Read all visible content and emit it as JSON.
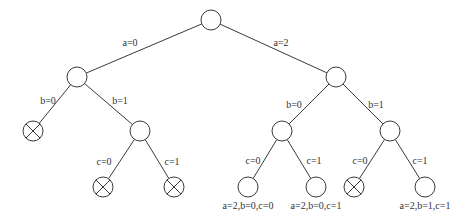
{
  "diagram": {
    "type": "decision-tree",
    "stroke_color": "#3a3a3a",
    "node_fill": "#ffffff",
    "node_radius": 10,
    "nodes": [
      {
        "id": "root",
        "x": 211,
        "y": 20,
        "pruned": false,
        "label": ""
      },
      {
        "id": "a0",
        "x": 77,
        "y": 77,
        "pruned": false,
        "label": ""
      },
      {
        "id": "a2",
        "x": 336,
        "y": 77,
        "pruned": false,
        "label": ""
      },
      {
        "id": "a0b0",
        "x": 33,
        "y": 131,
        "pruned": true,
        "label": ""
      },
      {
        "id": "a0b1",
        "x": 140,
        "y": 131,
        "pruned": false,
        "label": ""
      },
      {
        "id": "a2b0",
        "x": 282,
        "y": 131,
        "pruned": false,
        "label": ""
      },
      {
        "id": "a2b1",
        "x": 390,
        "y": 131,
        "pruned": false,
        "label": ""
      },
      {
        "id": "a0b1c0",
        "x": 103,
        "y": 187,
        "pruned": true,
        "label": ""
      },
      {
        "id": "a0b1c1",
        "x": 174,
        "y": 187,
        "pruned": true,
        "label": ""
      },
      {
        "id": "a2b0c0",
        "x": 248,
        "y": 187,
        "pruned": false,
        "label": "a=2,b=0,c=0"
      },
      {
        "id": "a2b0c1",
        "x": 316,
        "y": 187,
        "pruned": false,
        "label": "a=2,b=0,c=1"
      },
      {
        "id": "a2b1c0",
        "x": 354,
        "y": 187,
        "pruned": true,
        "label": ""
      },
      {
        "id": "a2b1c1",
        "x": 425,
        "y": 187,
        "pruned": false,
        "label": "a=2,b=1,c=1"
      }
    ],
    "edges": [
      {
        "from": "root",
        "to": "a0",
        "label": "a=0",
        "lx": 130,
        "ly": 46
      },
      {
        "from": "root",
        "to": "a2",
        "label": "a=2",
        "lx": 281,
        "ly": 46
      },
      {
        "from": "a0",
        "to": "a0b0",
        "label": "b=0",
        "lx": 48,
        "ly": 104
      },
      {
        "from": "a0",
        "to": "a0b1",
        "label": "b=1",
        "lx": 120,
        "ly": 104
      },
      {
        "from": "a2",
        "to": "a2b0",
        "label": "b=0",
        "lx": 294,
        "ly": 108
      },
      {
        "from": "a2",
        "to": "a2b1",
        "label": "b=1",
        "lx": 376,
        "ly": 108
      },
      {
        "from": "a0b1",
        "to": "a0b1c0",
        "label": "c=0",
        "lx": 104,
        "ly": 165
      },
      {
        "from": "a0b1",
        "to": "a0b1c1",
        "label": "c=1",
        "lx": 172,
        "ly": 165
      },
      {
        "from": "a2b0",
        "to": "a2b0c0",
        "label": "c=0",
        "lx": 253,
        "ly": 164
      },
      {
        "from": "a2b0",
        "to": "a2b0c1",
        "label": "c=1",
        "lx": 314,
        "ly": 164
      },
      {
        "from": "a2b1",
        "to": "a2b1c0",
        "label": "c=0",
        "lx": 360,
        "ly": 164
      },
      {
        "from": "a2b1",
        "to": "a2b1c1",
        "label": "c=1",
        "lx": 420,
        "ly": 164
      }
    ]
  }
}
